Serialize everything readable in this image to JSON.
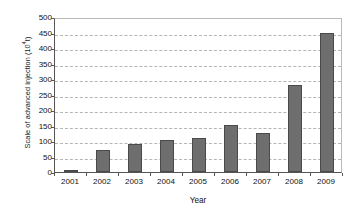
{
  "chart_data": {
    "type": "bar",
    "title": "",
    "xlabel": "Year",
    "ylabel_text": "Scale of advanced injection (10",
    "ylabel_exponent": "4",
    "ylabel_suffix": "t)",
    "ylabel_full": "Scale of advanced injection (10⁴t)",
    "categories": [
      "2001",
      "2002",
      "2003",
      "2004",
      "2005",
      "2006",
      "2007",
      "2008",
      "2009"
    ],
    "values": [
      5,
      72,
      90,
      103,
      110,
      152,
      125,
      280,
      450
    ],
    "ylim": [
      0,
      500
    ],
    "ytick_values": [
      0,
      50,
      100,
      150,
      200,
      250,
      300,
      350,
      400,
      450,
      500
    ],
    "ytick_labels": [
      "0",
      "50",
      "100",
      "150",
      "200",
      "250",
      "300",
      "350",
      "400",
      "450",
      "500"
    ],
    "grid": true,
    "grid_style": "dashed-horizontal",
    "legend": false,
    "legend_position": "none",
    "bar_color": "#6e6e6e",
    "bar_edge_color": "#4a4a4a",
    "gridline_color": "#b5b5b5",
    "axis_color": "#555555",
    "background_color": "#ffffff"
  }
}
